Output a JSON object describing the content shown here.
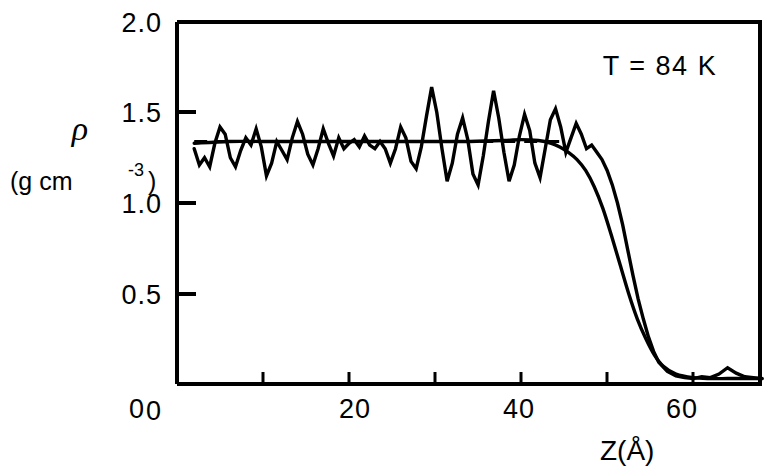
{
  "chart_data": {
    "type": "line",
    "title": "",
    "xlabel": "Z(Å)",
    "ylabel": "ρ (g cm⁻³)",
    "ylabel_symbol": "ρ",
    "ylabel_units_open": "(g cm",
    "ylabel_units_sup": "-3",
    "ylabel_units_close": ")",
    "annotation": "T = 84 K",
    "xlim": [
      0,
      68
    ],
    "ylim": [
      0,
      2.0
    ],
    "xticks": [
      0,
      10,
      20,
      30,
      40,
      50,
      60
    ],
    "xtick_labels": [
      "0",
      "",
      "20",
      "",
      "40",
      "",
      "60"
    ],
    "yticks": [
      0,
      0.5,
      1.0,
      1.5,
      2.0
    ],
    "ytick_labels": [
      "0",
      "0.5",
      "1.0",
      "1.5",
      "2.0"
    ],
    "grid": false,
    "legend": "none",
    "reference_line": {
      "name": "bulk-density-dashed",
      "value": 1.34,
      "style": "dashed",
      "x_start": 2.0,
      "x_end": 45.5
    },
    "series": [
      {
        "name": "oscillatory-density-profile",
        "style": "solid",
        "color": "#000000",
        "x": [
          2.0,
          2.6,
          3.2,
          3.8,
          4.4,
          5.0,
          5.6,
          6.2,
          6.8,
          7.4,
          8.0,
          8.6,
          9.2,
          9.8,
          10.4,
          11.0,
          11.6,
          12.2,
          12.8,
          13.4,
          14.0,
          14.6,
          15.2,
          15.8,
          16.4,
          17.0,
          17.6,
          18.2,
          18.8,
          19.4,
          20.0,
          20.6,
          21.2,
          21.8,
          22.4,
          23.0,
          23.6,
          24.2,
          24.8,
          25.4,
          26.0,
          26.6,
          27.2,
          27.8,
          28.4,
          29.0,
          29.6,
          30.2,
          30.8,
          31.4,
          32.0,
          32.6,
          33.2,
          33.8,
          34.4,
          35.0,
          35.6,
          36.2,
          36.8,
          37.4,
          38.0,
          38.6,
          39.2,
          39.8,
          40.4,
          41.0,
          41.6,
          42.2,
          42.8,
          43.4,
          44.0,
          44.6,
          45.2,
          45.8,
          46.4,
          47.0,
          47.6,
          48.2,
          48.8,
          49.4,
          50.0,
          50.6,
          51.2,
          51.8,
          52.4,
          53.0,
          53.6,
          54.2,
          54.8,
          55.4,
          56.0,
          57.0,
          58.0,
          59.0,
          60.0,
          61.0,
          62.0,
          63.0,
          64.0,
          65.0,
          66.0,
          67.0,
          68.0
        ],
        "y": [
          1.3,
          1.21,
          1.25,
          1.2,
          1.33,
          1.42,
          1.38,
          1.25,
          1.2,
          1.29,
          1.36,
          1.32,
          1.41,
          1.31,
          1.15,
          1.22,
          1.34,
          1.29,
          1.24,
          1.36,
          1.45,
          1.38,
          1.27,
          1.21,
          1.3,
          1.41,
          1.33,
          1.26,
          1.36,
          1.3,
          1.33,
          1.35,
          1.31,
          1.37,
          1.32,
          1.3,
          1.34,
          1.3,
          1.22,
          1.3,
          1.42,
          1.36,
          1.23,
          1.19,
          1.31,
          1.48,
          1.64,
          1.5,
          1.3,
          1.12,
          1.22,
          1.38,
          1.47,
          1.35,
          1.16,
          1.1,
          1.26,
          1.45,
          1.62,
          1.47,
          1.28,
          1.12,
          1.21,
          1.37,
          1.49,
          1.4,
          1.22,
          1.14,
          1.3,
          1.46,
          1.52,
          1.42,
          1.28,
          1.36,
          1.44,
          1.38,
          1.3,
          1.32,
          1.28,
          1.24,
          1.18,
          1.1,
          1.0,
          0.88,
          0.74,
          0.6,
          0.47,
          0.36,
          0.26,
          0.18,
          0.12,
          0.07,
          0.045,
          0.035,
          0.03,
          0.04,
          0.035,
          0.055,
          0.09,
          0.06,
          0.04,
          0.035,
          0.03
        ]
      },
      {
        "name": "smooth-intrinsic-profile",
        "style": "solid",
        "color": "#000000",
        "x": [
          2.0,
          6.0,
          10.0,
          14.0,
          18.0,
          22.0,
          26.0,
          30.0,
          34.0,
          38.0,
          40.0,
          42.0,
          43.5,
          44.5,
          45.5,
          46.5,
          47.5,
          48.5,
          49.5,
          50.5,
          51.5,
          52.5,
          53.5,
          54.5,
          55.5,
          56.5,
          58.0,
          60.0,
          62.0,
          64.0,
          66.0,
          68.0
        ],
        "y": [
          1.33,
          1.34,
          1.34,
          1.34,
          1.34,
          1.34,
          1.34,
          1.34,
          1.34,
          1.345,
          1.35,
          1.345,
          1.33,
          1.31,
          1.28,
          1.24,
          1.18,
          1.09,
          0.97,
          0.82,
          0.66,
          0.5,
          0.36,
          0.25,
          0.16,
          0.1,
          0.055,
          0.035,
          0.03,
          0.03,
          0.03,
          0.03
        ]
      }
    ]
  },
  "axes": {
    "y_top_label": "2.0",
    "y_label_15": "1.5",
    "y_label_10": "1.0",
    "y_label_05": "0.5",
    "y_label_0": "0",
    "x_label_0": "0",
    "x_label_20": "20",
    "x_label_40": "40",
    "x_label_60": "60"
  },
  "colors": {
    "ink": "#000000",
    "background": "#ffffff"
  }
}
